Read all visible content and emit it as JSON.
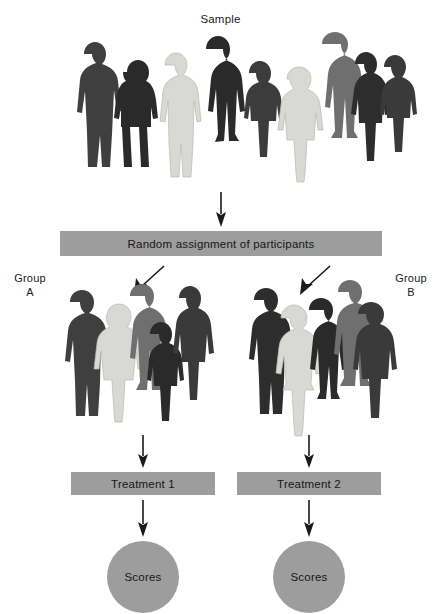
{
  "diagram": {
    "title": "Sample",
    "type": "experimental-design-flowchart",
    "sample_label": "Sample",
    "random_assignment_label": "Random assignment of participants",
    "group_a_label": "Group\nA",
    "group_b_label": "Group\nB",
    "treatment_1_label": "Treatment 1",
    "treatment_2_label": "Treatment 2",
    "scores_a_label": "Scores",
    "scores_b_label": "Scores",
    "colors": {
      "box_fill": "#9d9d9d",
      "circle_fill": "#9d9d9d",
      "text": "#171717",
      "arrow": "#1a1a1a",
      "background": "#ffffff",
      "silhouette_dark": "#3f3f3f",
      "silhouette_mid": "#6f6f6f",
      "silhouette_light": "#d8d8d4",
      "silhouette_darkest": "#2a2a2a"
    },
    "sample_people_count": 9,
    "group_a_people_count": 5,
    "group_b_people_count": 5,
    "arrows": [
      {
        "name": "sample-to-assignment",
        "direction": "down"
      },
      {
        "name": "assignment-to-group-a",
        "direction": "down-left"
      },
      {
        "name": "assignment-to-group-b",
        "direction": "down-left"
      },
      {
        "name": "group-a-to-treatment-1",
        "direction": "down"
      },
      {
        "name": "group-b-to-treatment-2",
        "direction": "down"
      },
      {
        "name": "treatment-1-to-scores",
        "direction": "down"
      },
      {
        "name": "treatment-2-to-scores",
        "direction": "down"
      }
    ]
  }
}
